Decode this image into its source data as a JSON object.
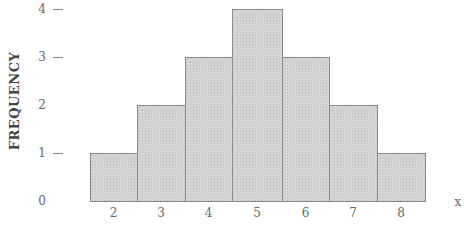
{
  "chart_data": {
    "type": "bar",
    "title": "",
    "xlabel": "x",
    "ylabel": "FREQUENCY",
    "categories": [
      "2",
      "3",
      "4",
      "5",
      "6",
      "7",
      "8"
    ],
    "values": [
      1,
      2,
      3,
      4,
      3,
      2,
      1
    ],
    "ylim": [
      0,
      4
    ],
    "yticks": [
      "0",
      "1",
      "2",
      "3",
      "4"
    ],
    "ytick_dashes": [
      false,
      true,
      false,
      true,
      true
    ],
    "grid": false,
    "legend": null,
    "bar_style": "histogram, contiguous bars, stippled gray fill",
    "colors": {
      "bar_fill": "#d8d8d8",
      "bar_border": "#8a8a8a"
    }
  }
}
